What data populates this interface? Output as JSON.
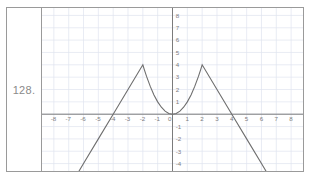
{
  "header": {
    "faint_text": ""
  },
  "problem": {
    "number_label": "128."
  },
  "chart_data": {
    "type": "line",
    "title": "",
    "xlabel": "",
    "ylabel": "",
    "xlim": [
      -8.8,
      8.8
    ],
    "ylim": [
      -4.6,
      8.6
    ],
    "grid": true,
    "legend": null,
    "x_ticks": [
      -8,
      -7,
      -6,
      -5,
      -4,
      -3,
      -2,
      -1,
      0,
      1,
      2,
      3,
      4,
      5,
      6,
      7,
      8
    ],
    "x_tick_labels": [
      "-8",
      "-7",
      "-6",
      "-5",
      "-4",
      "-3",
      "-2",
      "-1",
      "0",
      "1",
      "2",
      "3",
      "4",
      "5",
      "6",
      "7",
      "8"
    ],
    "y_ticks": [
      -4,
      -3,
      -2,
      -1,
      0,
      1,
      2,
      3,
      4,
      5,
      6,
      7,
      8
    ],
    "y_tick_labels": [
      "-4",
      "-3",
      "-2",
      "-1",
      "0",
      "1",
      "2",
      "3",
      "4",
      "5",
      "6",
      "7",
      "8"
    ],
    "series": [
      {
        "name": "piecewise-graph",
        "points": [
          [
            -7.0,
            -6.0
          ],
          [
            -6.0,
            -4.0
          ],
          [
            -5.0,
            -2.0
          ],
          [
            -4.0,
            0.0
          ],
          [
            -3.0,
            2.0
          ],
          [
            -2.0,
            4.0
          ],
          [
            -1.9,
            3.61
          ],
          [
            -1.75,
            3.0625
          ],
          [
            -1.5,
            2.25
          ],
          [
            -1.25,
            1.5625
          ],
          [
            -1.0,
            1.0
          ],
          [
            -0.75,
            0.5625
          ],
          [
            -0.5,
            0.25
          ],
          [
            -0.25,
            0.0625
          ],
          [
            0.0,
            0.0
          ],
          [
            0.25,
            0.0625
          ],
          [
            0.5,
            0.25
          ],
          [
            0.75,
            0.5625
          ],
          [
            1.0,
            1.0
          ],
          [
            1.25,
            1.5625
          ],
          [
            1.5,
            2.25
          ],
          [
            1.75,
            3.0625
          ],
          [
            1.9,
            3.61
          ],
          [
            2.0,
            4.0
          ],
          [
            3.0,
            2.0
          ],
          [
            4.0,
            0.0
          ],
          [
            5.0,
            -2.0
          ],
          [
            6.0,
            -4.0
          ],
          [
            7.0,
            -6.0
          ]
        ],
        "key_points": {
          "peak_left": [
            -2,
            4
          ],
          "peak_right": [
            2,
            4
          ],
          "vertex": [
            0,
            0
          ],
          "x_intercept_left": [
            -4,
            0
          ],
          "x_intercept_right": [
            4,
            0
          ]
        }
      }
    ]
  },
  "colors": {
    "curve": "#6e6e6e",
    "axis": "#7b7b7b",
    "grid": "#dfe4ef",
    "frame": "#9a9a9a",
    "label_text": "#8a8a8a",
    "tick_text": "#7d7d7d"
  }
}
